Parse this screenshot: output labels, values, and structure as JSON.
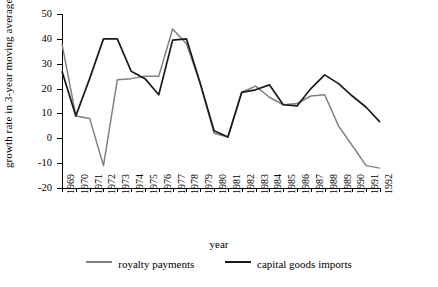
{
  "chart_data": {
    "type": "line",
    "title": "",
    "xlabel": "year",
    "ylabel": "growth rate in 3-year moving average, %",
    "ylim": [
      -20,
      50
    ],
    "yticks": [
      -20,
      -10,
      0,
      10,
      20,
      30,
      40,
      50
    ],
    "grid": false,
    "legend_position": "bottom",
    "categories": [
      "1969",
      "1970",
      "1971",
      "1972",
      "1973",
      "1974",
      "1975",
      "1976",
      "1977",
      "1978",
      "1979",
      "1980",
      "1981",
      "1982",
      "1983",
      "1984",
      "1985",
      "1986",
      "1987",
      "1988",
      "1989",
      "1990",
      "1991",
      "1992"
    ],
    "series": [
      {
        "name": "royalty payments",
        "color": "#808080",
        "values": [
          38,
          9,
          8,
          -11,
          23.5,
          24,
          25,
          25,
          44,
          38,
          22,
          2,
          0.5,
          18.5,
          21,
          16.5,
          13.5,
          14,
          17,
          17.5,
          5,
          -3,
          -11,
          -12
        ]
      },
      {
        "name": "capital goods imports",
        "color": "#1a1a1a",
        "values": [
          27,
          9,
          24,
          40,
          40,
          27,
          24,
          17.5,
          39.5,
          40,
          22,
          3,
          0.5,
          18.5,
          19.5,
          21.5,
          13.5,
          13,
          20,
          25.5,
          22,
          17,
          12.5,
          6.5
        ]
      }
    ]
  },
  "legend": {
    "items": [
      {
        "label": "royalty payments",
        "color": "#808080"
      },
      {
        "label": "capital goods imports",
        "color": "#1a1a1a"
      }
    ]
  }
}
